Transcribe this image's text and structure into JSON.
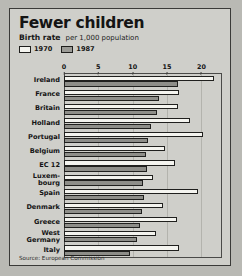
{
  "card": {
    "title": "Fewer children",
    "subtitle_main": "Birth rate",
    "subtitle_sub": "per 1,000 population",
    "source": "Source: European Commission"
  },
  "legend": {
    "items": [
      {
        "label": "1970",
        "swatch": "white",
        "color": "#f4f4ef"
      },
      {
        "label": "1987",
        "swatch": "grey",
        "color": "#8e8e89"
      }
    ]
  },
  "chart_data": {
    "type": "bar",
    "orientation": "horizontal",
    "title": "Fewer children",
    "subtitle": "Birth rate per 1,000 population",
    "xlabel": "",
    "ylabel": "",
    "xlim": [
      0,
      23
    ],
    "ticks": [
      0,
      5,
      10,
      15,
      20
    ],
    "grid": true,
    "legend_position": "top-left",
    "source": "Source: European Commission",
    "categories": [
      "Ireland",
      "France",
      "Britain",
      "Holland",
      "Portugal",
      "Belgium",
      "EC 12",
      "Luxem-\nbourg",
      "Spain",
      "Denmark",
      "Greece",
      "West\nGermany",
      "Italy"
    ],
    "series": [
      {
        "name": "1970",
        "color": "#f4f4ef",
        "values": [
          21.8,
          16.8,
          16.6,
          18.3,
          20.2,
          14.7,
          16.2,
          13.0,
          19.5,
          14.4,
          16.5,
          13.4,
          16.8
        ]
      },
      {
        "name": "1987",
        "color": "#8e8e89",
        "values": [
          16.6,
          13.8,
          13.6,
          12.6,
          12.2,
          11.9,
          12.1,
          11.5,
          11.7,
          11.4,
          11.1,
          10.6,
          9.6
        ]
      }
    ]
  }
}
